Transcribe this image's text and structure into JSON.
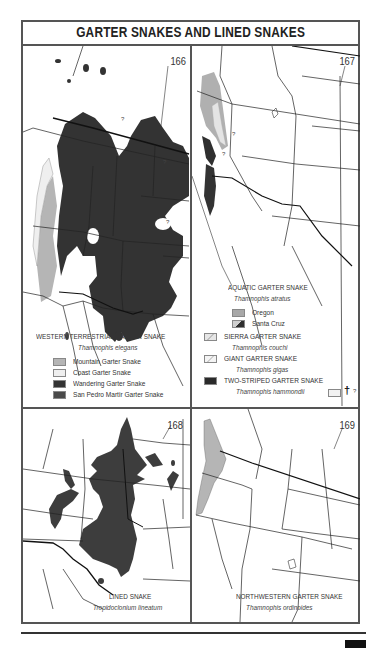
{
  "page": {
    "title": "GARTER SNAKES AND LINED SNAKES"
  },
  "colors": {
    "mountain": "#b5b5b5",
    "coast": "#efefef",
    "wandering": "#333333",
    "san_pedro": "#4a4a4a",
    "oregon": "#a8a8a8",
    "santa_cruz": "#2f2f2f",
    "range_dark": "#3a3a3a",
    "range_light": "#bdbdbd"
  },
  "maps": [
    {
      "number": "166",
      "legend": {
        "title": "WESTERN TERRESTRIAL GARTER SNAKE",
        "scientific": "Thamnophis elegans",
        "items": [
          {
            "label": "Mountain Garter Snake",
            "swatch": "mountain"
          },
          {
            "label": "Coast Garter Snake",
            "swatch": "coast"
          },
          {
            "label": "Wandering Garter Snake",
            "swatch": "wandering"
          },
          {
            "label": "San Pedro Martir Garter Snake",
            "swatch": "san_pedro"
          }
        ]
      },
      "markers": [
        "?",
        "?",
        "?"
      ]
    },
    {
      "number": "167",
      "legend": {
        "species": [
          {
            "title": "AQUATIC GARTER SNAKE",
            "scientific": "Thamnophis atratus",
            "items": [
              {
                "label": "Oregon",
                "swatch": "oregon"
              },
              {
                "label": "Santa Cruz",
                "swatch": "santa_cruz"
              }
            ]
          },
          {
            "title": "SIERRA GARTER SNAKE",
            "scientific": "Thamnophis couchi",
            "swatch": "sierra"
          },
          {
            "title": "GIANT GARTER SNAKE",
            "scientific": "Thamnophis gigas",
            "swatch": "giant"
          },
          {
            "title": "TWO-STRIPED GARTER SNAKE",
            "scientific": "Thamnophis hammondii",
            "swatch": "two_striped"
          }
        ],
        "extinct_marker": "†",
        "uncertain_marker": "?"
      },
      "markers": [
        "?",
        "?"
      ]
    },
    {
      "number": "168",
      "legend": {
        "title": "LINED SNAKE",
        "scientific": "Tropidoclonium lineatum"
      }
    },
    {
      "number": "169",
      "legend": {
        "title": "NORTHWESTERN GARTER SNAKE",
        "scientific": "Thamnophis ordinoides"
      }
    }
  ]
}
